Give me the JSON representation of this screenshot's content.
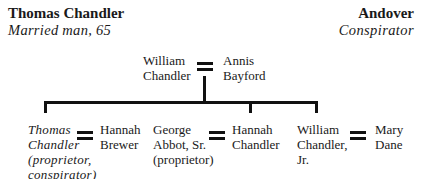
{
  "header": {
    "name": "Thomas Chandler",
    "subtitle": "Married man, 65",
    "place": "Andover",
    "role": "Conspirator"
  },
  "tree": {
    "parents": {
      "husband": "William\nChandler",
      "wife": "Annis\nBayford"
    },
    "children": [
      {
        "person": "Thomas\nChandler\n(proprietor,\nconspirator)",
        "italic": true,
        "spouse": "Hannah\nBrewer"
      },
      {
        "person": "George\nAbbot, Sr.\n(proprietor)",
        "italic": false,
        "spouse": "Hannah\nChandler"
      },
      {
        "person": "William\nChandler,\nJr.",
        "italic": false,
        "spouse": "Mary\nDane"
      }
    ]
  }
}
